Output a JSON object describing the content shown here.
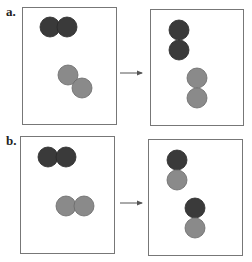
{
  "colors": {
    "dark": "#3a3a3a",
    "light": "#8a8a8a",
    "frame": "#777777",
    "arrow": "#555555"
  },
  "panels": [
    {
      "label": "a.",
      "label_pos": [
        6,
        12
      ],
      "before": {
        "box": [
          22,
          7,
          94,
          117
        ],
        "circles": [
          {
            "cx": 50,
            "cy": 27,
            "shade": "dark"
          },
          {
            "cx": 67,
            "cy": 27,
            "shade": "dark"
          },
          {
            "cx": 68,
            "cy": 75,
            "shade": "light"
          },
          {
            "cx": 82,
            "cy": 88,
            "shade": "light"
          }
        ]
      },
      "arrow": {
        "x1": 120,
        "x2": 142,
        "y": 73
      },
      "after": {
        "box": [
          150,
          9,
          93,
          116
        ],
        "circles": [
          {
            "cx": 179,
            "cy": 30,
            "shade": "dark"
          },
          {
            "cx": 179,
            "cy": 50,
            "shade": "dark"
          },
          {
            "cx": 197,
            "cy": 78,
            "shade": "light"
          },
          {
            "cx": 197,
            "cy": 98,
            "shade": "light"
          }
        ]
      }
    },
    {
      "label": "b.",
      "label_pos": [
        6,
        141
      ],
      "before": {
        "box": [
          20,
          136,
          94,
          117
        ],
        "circles": [
          {
            "cx": 48,
            "cy": 157,
            "shade": "dark"
          },
          {
            "cx": 66,
            "cy": 157,
            "shade": "dark"
          },
          {
            "cx": 66,
            "cy": 206,
            "shade": "light"
          },
          {
            "cx": 84,
            "cy": 206,
            "shade": "light"
          }
        ]
      },
      "arrow": {
        "x1": 120,
        "x2": 142,
        "y": 203
      },
      "after": {
        "box": [
          148,
          139,
          94,
          116
        ],
        "circles": [
          {
            "cx": 177,
            "cy": 160,
            "shade": "dark"
          },
          {
            "cx": 177,
            "cy": 180,
            "shade": "light"
          },
          {
            "cx": 195,
            "cy": 208,
            "shade": "dark"
          },
          {
            "cx": 195,
            "cy": 228,
            "shade": "light"
          }
        ]
      }
    }
  ],
  "circle_radius": 10
}
